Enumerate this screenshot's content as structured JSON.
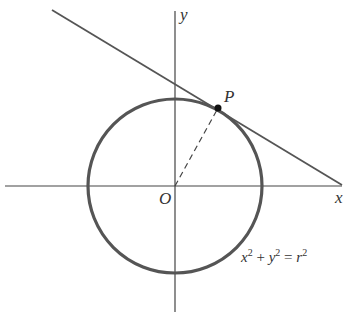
{
  "diagram": {
    "labels": {
      "y_axis": "y",
      "x_axis": "x",
      "origin": "O",
      "point": "P",
      "equation": {
        "x": "x",
        "y": "y",
        "r": "r",
        "exp": "2",
        "plus": " + ",
        "eq": " = "
      }
    },
    "colors": {
      "circle": "#555555",
      "lines": "#555555",
      "point": "#111111"
    }
  }
}
